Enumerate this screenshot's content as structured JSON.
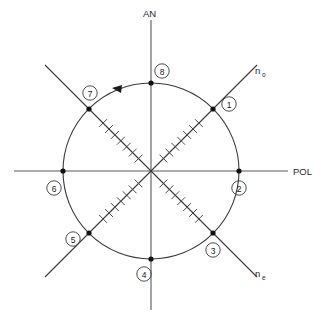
{
  "figure": {
    "type": "polarization-circle-diagram",
    "background_color": "#ffffff",
    "line_color": "#3a3a3c",
    "axis_color": "#58585a",
    "marker_color": "#111111"
  },
  "axes": {
    "vertical": {
      "label": "AN",
      "name": "analyzer-axis",
      "orientation": "vertical"
    },
    "horizontal": {
      "label": "POL",
      "name": "polarizer-axis",
      "orientation": "horizontal"
    },
    "diagonal_up": {
      "label_base": "n",
      "label_sub": "o",
      "name": "ordinary-index-axis",
      "orientation": "diagonal-up-right"
    },
    "diagonal_down": {
      "label_base": "n",
      "label_sub": "e",
      "name": "extraordinary-index-axis",
      "orientation": "diagonal-down-right"
    }
  },
  "circle": {
    "center_x": 151,
    "center_y": 171,
    "radius": 88
  },
  "rotation_arrow": {
    "direction": "counterclockwise",
    "position_x": 116,
    "position_y": 89
  },
  "markers": [
    {
      "id": "1",
      "label": "1",
      "dot_x": 213,
      "dot_y": 109,
      "label_x": 229,
      "label_y": 104,
      "on_axis": "diagonal_up"
    },
    {
      "id": "2",
      "label": "2",
      "dot_x": 239,
      "dot_y": 171,
      "label_x": 239,
      "label_y": 188,
      "on_axis": "horizontal"
    },
    {
      "id": "3",
      "label": "3",
      "dot_x": 213,
      "dot_y": 233,
      "label_x": 213,
      "label_y": 250,
      "on_axis": "diagonal_down"
    },
    {
      "id": "4",
      "label": "4",
      "dot_x": 151,
      "dot_y": 259,
      "label_x": 144,
      "label_y": 274,
      "on_axis": "vertical"
    },
    {
      "id": "5",
      "label": "5",
      "dot_x": 89,
      "dot_y": 233,
      "label_x": 73,
      "label_y": 239,
      "on_axis": "diagonal_up"
    },
    {
      "id": "6",
      "label": "6",
      "dot_x": 63,
      "dot_y": 171,
      "label_x": 54,
      "label_y": 188,
      "on_axis": "horizontal"
    },
    {
      "id": "7",
      "label": "7",
      "dot_x": 89,
      "dot_y": 109,
      "label_x": 90,
      "label_y": 93,
      "on_axis": "diagonal_down"
    },
    {
      "id": "8",
      "label": "8",
      "dot_x": 151,
      "dot_y": 83,
      "label_x": 162,
      "label_y": 71,
      "on_axis": "vertical"
    }
  ],
  "tick_marks": {
    "count_per_ray": 7,
    "description": "perpendicular hatch marks along each diagonal ray"
  }
}
